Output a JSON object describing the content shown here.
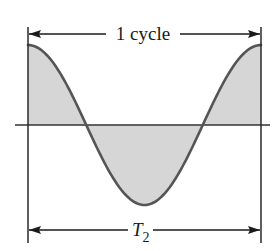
{
  "diagram": {
    "top_dimension": {
      "label": "1 cycle"
    },
    "bottom_dimension": {
      "label_main": "T",
      "label_subscript": "2"
    },
    "waveform": {
      "shape": "cosine",
      "cycles": 1,
      "fill_color": "#d6d6d6",
      "stroke_color": "#555555"
    },
    "colors": {
      "lines": "#2a2a2a",
      "axis": "#333333",
      "background": "#ffffff"
    }
  }
}
